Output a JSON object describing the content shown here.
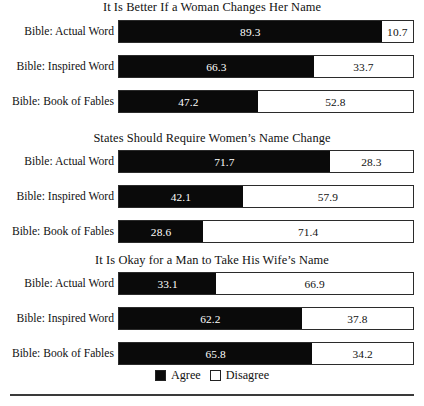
{
  "chart_data": {
    "type": "bar",
    "orientation": "horizontal",
    "stacked": true,
    "title": "",
    "xlabel": "",
    "ylabel": "",
    "xlim": [
      0,
      100
    ],
    "grid": false,
    "legend_position": "bottom",
    "legend": [
      "Agree",
      "Disagree"
    ],
    "categories": [
      "Bible: Actual Word",
      "Bible: Inspired Word",
      "Bible: Book of Fables"
    ],
    "panels": [
      {
        "title": "It Is Better If a Woman Changes Her Name",
        "rows": [
          {
            "category": "Bible: Actual Word",
            "agree": 89.3,
            "disagree": 10.7
          },
          {
            "category": "Bible: Inspired Word",
            "agree": 66.3,
            "disagree": 33.7
          },
          {
            "category": "Bible: Book of Fables",
            "agree": 47.2,
            "disagree": 52.8
          }
        ]
      },
      {
        "title": "States Should Require Women’s Name Change",
        "rows": [
          {
            "category": "Bible: Actual Word",
            "agree": 71.7,
            "disagree": 28.3
          },
          {
            "category": "Bible: Inspired Word",
            "agree": 42.1,
            "disagree": 57.9
          },
          {
            "category": "Bible: Book of Fables",
            "agree": 28.6,
            "disagree": 71.4
          }
        ]
      },
      {
        "title": "It Is Okay for a Man to Take His Wife’s Name",
        "rows": [
          {
            "category": "Bible: Actual Word",
            "agree": 33.1,
            "disagree": 66.9
          },
          {
            "category": "Bible: Inspired Word",
            "agree": 62.2,
            "disagree": 37.8
          },
          {
            "category": "Bible: Book of Fables",
            "agree": 65.8,
            "disagree": 34.2
          }
        ]
      }
    ],
    "colors": {
      "agree": "#0a0a0a",
      "disagree": "#ffffff",
      "outline": "#2b2b2b",
      "text": "#111111"
    }
  },
  "legend": {
    "agree_label": "Agree",
    "disagree_label": "Disagree"
  }
}
